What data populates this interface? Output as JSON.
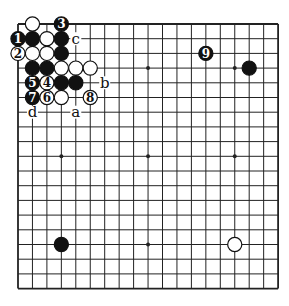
{
  "diagram": {
    "type": "go-board",
    "size": 19,
    "origin": {
      "x": 18,
      "y": 24
    },
    "spacing": {
      "x": 14.45,
      "y": 14.7
    },
    "colors": {
      "background": "#ffffff",
      "line": "#222222",
      "black_stone": "#111111",
      "white_stone": "#ffffff",
      "stone_outline": "#111111"
    },
    "star_points": [
      [
        3,
        3
      ],
      [
        9,
        3
      ],
      [
        15,
        3
      ],
      [
        3,
        9
      ],
      [
        9,
        9
      ],
      [
        15,
        9
      ],
      [
        3,
        15
      ],
      [
        9,
        15
      ],
      [
        15,
        15
      ]
    ],
    "stones": [
      {
        "col": 1,
        "row": 0,
        "color": "white",
        "label": ""
      },
      {
        "col": 3,
        "row": 0,
        "color": "black",
        "label": "3"
      },
      {
        "col": 0,
        "row": 1,
        "color": "black",
        "label": "1"
      },
      {
        "col": 1,
        "row": 1,
        "color": "black",
        "label": ""
      },
      {
        "col": 2,
        "row": 1,
        "color": "white",
        "label": ""
      },
      {
        "col": 3,
        "row": 1,
        "color": "black",
        "label": ""
      },
      {
        "col": 0,
        "row": 2,
        "color": "white",
        "label": "2"
      },
      {
        "col": 1,
        "row": 2,
        "color": "white",
        "label": ""
      },
      {
        "col": 2,
        "row": 2,
        "color": "white",
        "label": ""
      },
      {
        "col": 3,
        "row": 2,
        "color": "black",
        "label": ""
      },
      {
        "col": 1,
        "row": 3,
        "color": "black",
        "label": ""
      },
      {
        "col": 2,
        "row": 3,
        "color": "black",
        "label": ""
      },
      {
        "col": 3,
        "row": 3,
        "color": "white",
        "label": ""
      },
      {
        "col": 4,
        "row": 3,
        "color": "white",
        "label": ""
      },
      {
        "col": 5,
        "row": 3,
        "color": "white",
        "label": ""
      },
      {
        "col": 1,
        "row": 4,
        "color": "black",
        "label": "5"
      },
      {
        "col": 2,
        "row": 4,
        "color": "white",
        "label": "4"
      },
      {
        "col": 3,
        "row": 4,
        "color": "black",
        "label": ""
      },
      {
        "col": 4,
        "row": 4,
        "color": "black",
        "label": ""
      },
      {
        "col": 1,
        "row": 5,
        "color": "black",
        "label": "7"
      },
      {
        "col": 2,
        "row": 5,
        "color": "white",
        "label": "6"
      },
      {
        "col": 3,
        "row": 5,
        "color": "white",
        "label": ""
      },
      {
        "col": 5,
        "row": 5,
        "color": "white",
        "label": "8"
      },
      {
        "col": 13,
        "row": 2,
        "color": "black",
        "label": "9"
      },
      {
        "col": 16,
        "row": 3,
        "color": "black",
        "label": ""
      },
      {
        "col": 3,
        "row": 15,
        "color": "black",
        "label": ""
      },
      {
        "col": 15,
        "row": 15,
        "color": "white",
        "label": ""
      }
    ],
    "point_labels": [
      {
        "col": 4,
        "row": 1,
        "text": "c"
      },
      {
        "col": 6,
        "row": 4,
        "text": "b"
      },
      {
        "col": 1,
        "row": 6,
        "text": "d"
      },
      {
        "col": 4,
        "row": 6,
        "text": "a"
      }
    ]
  }
}
